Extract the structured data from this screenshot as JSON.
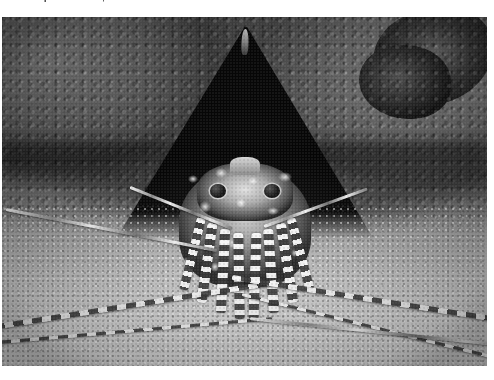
{
  "page": {
    "background_color": "#ffffff",
    "width": 494,
    "height": 380
  },
  "caption": {
    "text": "Lobster reported absent, a number of animals",
    "note": "top caption line is vertically clipped; only the lower pixel rows of the glyphs are rendered",
    "color": "#1a1a1a"
  },
  "photo": {
    "alt": "Black and white underwater photograph of a spiny lobster sheltering in a dark triangular crevice between two coral heads covered with tubular polyps, its long banded antennae spread across the pale sandy seafloor",
    "x": 2,
    "y": 17,
    "width": 485,
    "height": 349,
    "color_mode": "grayscale",
    "tones": {
      "coral_dark": "#3c3c3c",
      "coral_mid": "#6e6e6e",
      "coral_light": "#8f8f8f",
      "crevice_black": "#0a0a0a",
      "sand_light": "#d6d6d6",
      "highlight_white": "#f5f5f5"
    },
    "subject": {
      "name": "spiny lobster",
      "features": [
        "stalked dark eyes",
        "spotted white-blotched carapace",
        "spiny head plate",
        "banded walking legs",
        "long whip antennae"
      ]
    },
    "scene_elements": [
      "left coral mass with polyps",
      "right coral mass with polyps",
      "dark rocky knob upper right",
      "triangular den opening",
      "sandy seafloor"
    ]
  }
}
